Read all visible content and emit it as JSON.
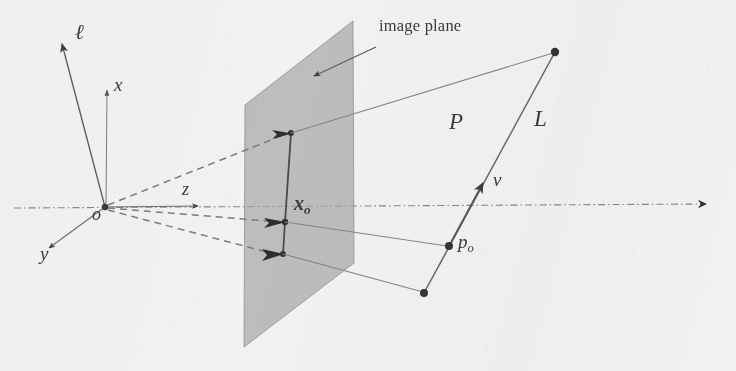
{
  "figure": {
    "background_color": "#f3f2f1",
    "ink_color": "#3a3a3c",
    "plane_fill_color": "#a9a9a9",
    "width": 736,
    "height": 371
  },
  "labels": {
    "ell_axis": "ℓ",
    "x_axis": "x",
    "y_axis": "y",
    "z_axis": "z",
    "origin": "o",
    "image_point": "x",
    "image_point_sub": "o",
    "plane_P": "P",
    "line_L": "L",
    "direction_v": "v",
    "base_point": "p",
    "base_point_sub": "o",
    "image_plane_callout": "image plane"
  },
  "geometry": {
    "origin": {
      "x": 105,
      "y": 207
    },
    "optical_axis": {
      "style": "dash-dot",
      "from": {
        "x": 14,
        "y": 208
      },
      "to": {
        "x": 712,
        "y": 204
      }
    },
    "axes": [
      {
        "name": "ell-axis",
        "label": "ℓ",
        "from": {
          "x": 105,
          "y": 207
        },
        "to": {
          "x": 61,
          "y": 42
        },
        "label_pos": {
          "x": 76,
          "y": 26
        }
      },
      {
        "name": "x-axis",
        "label": "x",
        "from": {
          "x": 105,
          "y": 207
        },
        "to": {
          "x": 107,
          "y": 88
        },
        "label_pos": {
          "x": 116,
          "y": 78
        }
      },
      {
        "name": "y-axis",
        "label": "y",
        "from": {
          "x": 105,
          "y": 207
        },
        "to": {
          "x": 47,
          "y": 249
        },
        "label_pos": {
          "x": 42,
          "y": 252
        }
      },
      {
        "name": "z-axis",
        "label": "z",
        "from": {
          "x": 105,
          "y": 207
        },
        "to": {
          "x": 200,
          "y": 206
        },
        "label_pos": {
          "x": 186,
          "y": 184
        }
      }
    ],
    "image_plane": {
      "name": "image-plane",
      "corners": [
        {
          "x": 245,
          "y": 105
        },
        {
          "x": 353,
          "y": 21
        },
        {
          "x": 354,
          "y": 263
        },
        {
          "x": 244,
          "y": 347
        }
      ],
      "fill": "#a9a9a9",
      "opacity": 0.72
    },
    "callout_arrow": {
      "name": "image-plane-callout-arrow",
      "from": {
        "x": 374,
        "y": 48
      },
      "to": {
        "x": 313,
        "y": 76
      }
    },
    "line_L": {
      "name": "line-L",
      "top_endpoint": {
        "x": 555,
        "y": 52
      },
      "bottom_endpoint": {
        "x": 424,
        "y": 293
      },
      "base_point": {
        "x": 449,
        "y": 246
      },
      "direction_arrow_tip": {
        "x": 481,
        "y": 187
      }
    },
    "projected_segment": {
      "name": "projected-segment",
      "top": {
        "x": 291,
        "y": 133
      },
      "middle": {
        "x": 285,
        "y": 222
      },
      "bottom": {
        "x": 283,
        "y": 254
      }
    },
    "projection_rays": [
      {
        "name": "ray-to-top",
        "from": {
          "x": 105,
          "y": 207
        },
        "to": {
          "x": 289,
          "y": 133
        }
      },
      {
        "name": "ray-to-middle",
        "from": {
          "x": 105,
          "y": 207
        },
        "to": {
          "x": 283,
          "y": 222
        }
      },
      {
        "name": "ray-to-bottom",
        "from": {
          "x": 105,
          "y": 207
        },
        "to": {
          "x": 281,
          "y": 255
        }
      }
    ],
    "projection_cone_edges": [
      {
        "name": "cone-edge-top",
        "from": {
          "x": 291,
          "y": 133
        },
        "to": {
          "x": 555,
          "y": 52
        }
      },
      {
        "name": "cone-edge-middle",
        "from": {
          "x": 285,
          "y": 222
        },
        "to": {
          "x": 449,
          "y": 246
        }
      },
      {
        "name": "cone-edge-bottom",
        "from": {
          "x": 283,
          "y": 254
        },
        "to": {
          "x": 424,
          "y": 293
        }
      }
    ],
    "label_positions": {
      "plane_P": {
        "x": 453,
        "y": 120
      },
      "line_L": {
        "x": 538,
        "y": 117
      },
      "direction_v": {
        "x": 496,
        "y": 177
      },
      "base_point": {
        "x": 460,
        "y": 240
      },
      "image_point": {
        "x": 297,
        "y": 200
      },
      "image_plane_callout": {
        "x": 381,
        "y": 21
      },
      "origin": {
        "x": 96,
        "y": 210
      }
    }
  }
}
